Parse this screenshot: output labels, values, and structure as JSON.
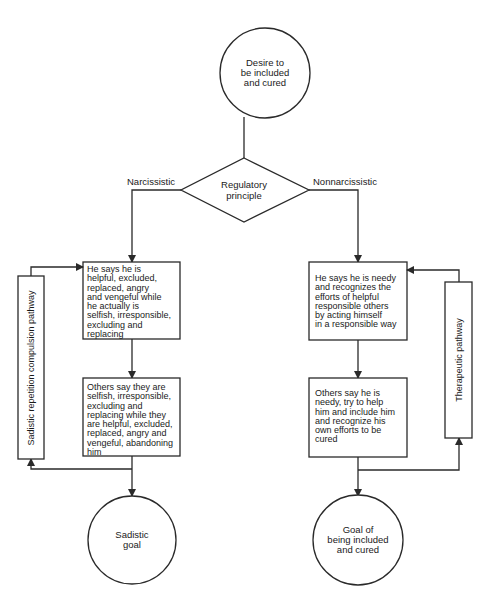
{
  "diagram": {
    "start_node": {
      "label": "Desire to\nbe included\nand cured",
      "lines": [
        "Desire to",
        "be included",
        "and cured"
      ]
    },
    "decision": {
      "lines": [
        "Regulatory",
        "principle"
      ]
    },
    "branches": {
      "left_label": "Narcissistic",
      "right_label": "Nonnarcissistic"
    },
    "left": {
      "box1": "He says he is\nhelpful, excluded,\nreplaced, angry\nand vengeful while\nhe actually is\nselfish, irresponsible,\nexcluding and\nreplacing",
      "box2": "Others say they are\nselfish, irresponsible,\nexcluding and\nreplacing while they\nare helpful, excluded,\nreplaced, angry and\nvengeful, abandoning\nhim",
      "pathway": "Sadistic repetition compulsion pathway",
      "goal": {
        "lines": [
          "Sadistic",
          "goal"
        ]
      }
    },
    "right": {
      "box1": "He says he is needy\nand recognizes the\nefforts of helpful\nresponsible others\nby acting himself\nin a responsible way",
      "box2": "Others say he is\nneedy, try to help\nhim and include him\nand recognize his\nown efforts to be\ncured",
      "pathway": "Therapeutic pathway",
      "goal": {
        "lines": [
          "Goal of",
          "being included",
          "and cured"
        ]
      }
    },
    "colors": {
      "stroke": "#2a2a2a",
      "background": "#ffffff",
      "text": "#1a1a1a"
    }
  }
}
